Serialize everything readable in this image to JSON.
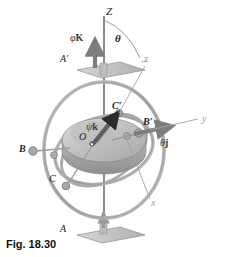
{
  "figure": {
    "caption": "Fig. 18.30"
  },
  "axes": [
    {
      "id": "Z",
      "label": "Z",
      "x": 106,
      "y": 6,
      "style": "dark",
      "size": 11
    },
    {
      "id": "z",
      "label": "z",
      "x": 144,
      "y": 55,
      "style": "faint",
      "size": 10
    },
    {
      "id": "y",
      "label": "y",
      "x": 202,
      "y": 120,
      "style": "faint",
      "size": 10
    },
    {
      "id": "x",
      "label": "x",
      "x": 151,
      "y": 203,
      "style": "faint",
      "size": 10
    }
  ],
  "angle": {
    "label": "θ",
    "x": 115,
    "y": 38
  },
  "vectors": [
    {
      "id": "phi-dot-K",
      "dot": "φ̇",
      "base": "K",
      "x": 73,
      "y": 38
    },
    {
      "id": "psi-dot-k",
      "dot": "ψ̇",
      "base": "k",
      "x": 86,
      "y": 126
    },
    {
      "id": "theta-dot-j",
      "dot": "θ̇",
      "base": "j",
      "x": 162,
      "y": 141
    }
  ],
  "points": [
    {
      "id": "A-prime",
      "label": "A′",
      "x": 62,
      "y": 57
    },
    {
      "id": "B-prime",
      "label": "B′",
      "x": 144,
      "y": 123
    },
    {
      "id": "C-prime",
      "label": "C′",
      "x": 112,
      "y": 107
    },
    {
      "id": "O-center",
      "label": "O",
      "x": 80,
      "y": 136
    },
    {
      "id": "B-left",
      "label": "B",
      "x": 20,
      "y": 149
    },
    {
      "id": "C-lower",
      "label": "C",
      "x": 50,
      "y": 179
    },
    {
      "id": "A-base",
      "label": "A",
      "x": 61,
      "y": 228
    }
  ],
  "colors": {
    "background": "#ffffff",
    "ring_outer": "#b3b3b3",
    "ring_inner": "#a9a9a9",
    "rotor_top": "#c9c9c9",
    "rotor_side": "#9f9f9f",
    "plate": "#c4c4c4",
    "vector_arrow": "#7d7d7d",
    "shaft": "#2b2b2b",
    "text": "#1d1d1d",
    "faint_text": "#9a9a9a"
  }
}
